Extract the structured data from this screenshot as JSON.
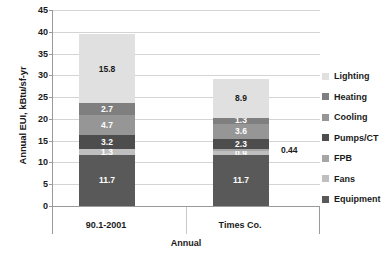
{
  "chart_data": {
    "type": "bar",
    "subtype": "stacked-bar",
    "title": "",
    "xlabel": "Annual",
    "ylabel": "Annual EUI, kBtu/sf-yr",
    "categories": [
      "90.1-2001",
      "Times Co."
    ],
    "ylim": [
      0,
      45
    ],
    "ytick_step": 5,
    "yticks": [
      0,
      5,
      10,
      15,
      20,
      25,
      30,
      35,
      40,
      45
    ],
    "grid": true,
    "legend_position": "right",
    "stack_order_bottom_to_top": [
      "Equipment",
      "Fans",
      "FPB",
      "Pumps/CT",
      "Cooling",
      "Heating",
      "Lighting"
    ],
    "series": [
      {
        "name": "Equipment",
        "color": "#595959",
        "values": [
          11.7,
          11.7
        ],
        "labels": [
          "11.7",
          "11.7"
        ],
        "label_color": "dark"
      },
      {
        "name": "Fans",
        "color": "#bfbfbf",
        "values": [
          1.3,
          0.9
        ],
        "labels": [
          "1.3",
          "0.9"
        ],
        "label_color": "dark"
      },
      {
        "name": "FPB",
        "color": "#a6a6a6",
        "values": [
          0.0,
          0.44
        ],
        "labels": [
          "",
          ""
        ],
        "label_color": "light"
      },
      {
        "name": "Pumps/CT",
        "color": "#4d4d4d",
        "values": [
          3.2,
          2.3
        ],
        "labels": [
          "3.2",
          "2.3"
        ],
        "label_color": "dark"
      },
      {
        "name": "Cooling",
        "color": "#969696",
        "values": [
          4.7,
          3.6
        ],
        "labels": [
          "4.7",
          "3.6"
        ],
        "label_color": "dark"
      },
      {
        "name": "Heating",
        "color": "#7f7f7f",
        "values": [
          2.7,
          1.3
        ],
        "labels": [
          "2.7",
          "1.3"
        ],
        "label_color": "dark"
      },
      {
        "name": "Lighting",
        "color": "#e0e0e0",
        "values": [
          15.8,
          8.9
        ],
        "labels": [
          "15.8",
          "8.9"
        ],
        "label_color": "light"
      }
    ],
    "totals": [
      39.4,
      29.14
    ],
    "annotations": [
      {
        "text": "0.44",
        "series": "FPB",
        "category": "Times Co.",
        "placement": "outside-right"
      }
    ]
  },
  "legend": {
    "items": [
      {
        "label": "Lighting",
        "color": "#e0e0e0"
      },
      {
        "label": "Heating",
        "color": "#7f7f7f"
      },
      {
        "label": "Cooling",
        "color": "#969696"
      },
      {
        "label": "Pumps/CT",
        "color": "#4d4d4d"
      },
      {
        "label": "FPB",
        "color": "#a6a6a6"
      },
      {
        "label": "Fans",
        "color": "#bfbfbf"
      },
      {
        "label": "Equipment",
        "color": "#595959"
      }
    ]
  }
}
